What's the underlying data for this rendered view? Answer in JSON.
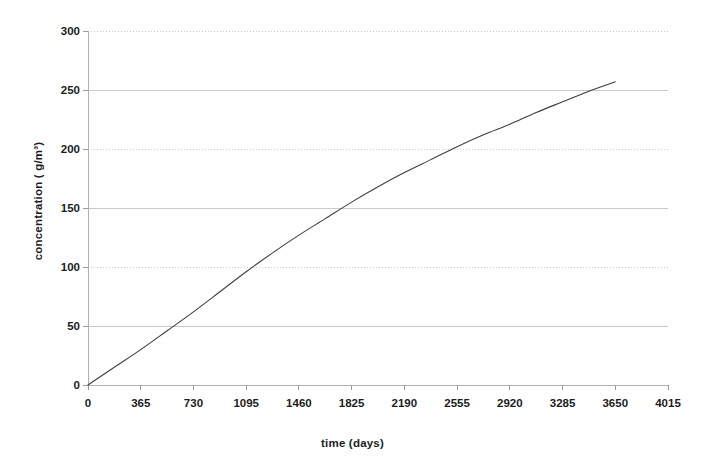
{
  "chart_data": {
    "type": "line",
    "title": "",
    "xlabel": "time (days)",
    "ylabel": "concentration ( g/m³)",
    "xlim": [
      0,
      4015
    ],
    "ylim": [
      0,
      300
    ],
    "xticks": [
      0,
      365,
      730,
      1095,
      1460,
      1825,
      2190,
      2555,
      2920,
      3285,
      3650,
      4015
    ],
    "xtick_labels": [
      "0",
      "365",
      "730",
      "1095",
      "1460",
      "1825",
      "2190",
      "2555",
      "2920",
      "3285",
      "3650",
      "4015"
    ],
    "yticks": [
      0,
      50,
      100,
      150,
      200,
      250,
      300
    ],
    "ytick_labels": [
      "0",
      "50",
      "100",
      "150",
      "200",
      "250",
      "300"
    ],
    "grid": "horizontal",
    "legend": "none",
    "series": [
      {
        "name": "concentration",
        "color": "#3d3d46",
        "x": [
          0,
          182,
          365,
          548,
          730,
          913,
          1095,
          1278,
          1460,
          1643,
          1825,
          2008,
          2190,
          2373,
          2555,
          2738,
          2920,
          3103,
          3285,
          3468,
          3650
        ],
        "values": [
          0,
          15,
          30,
          46,
          62,
          79,
          96,
          112,
          127,
          141,
          155,
          168,
          180,
          191,
          202,
          212,
          221,
          231,
          240,
          249,
          257
        ]
      }
    ]
  },
  "axes": {
    "y_title": "concentration ( g/m³)",
    "x_title": "time (days)"
  }
}
